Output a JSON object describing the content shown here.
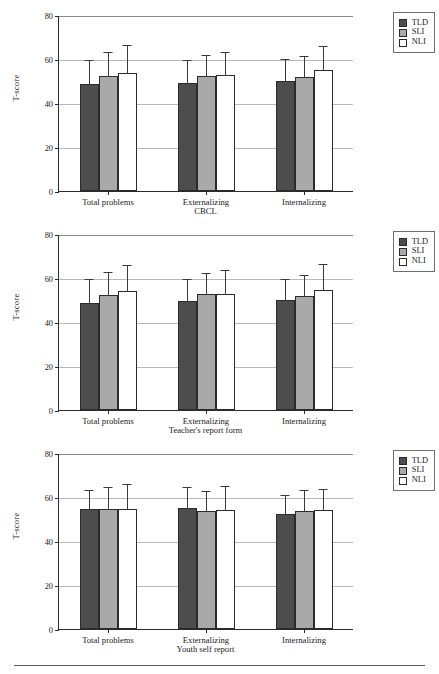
{
  "figure": {
    "bottom_rule": true,
    "colors": {
      "tld": "#4d4d4d",
      "sli": "#a9a9a9",
      "nli": "#ffffff",
      "axis": "#2b2b2b",
      "grid": "#b9b9b9"
    }
  },
  "legend": {
    "items": [
      {
        "label": "TLD",
        "key": "tld"
      },
      {
        "label": "SLI",
        "key": "sli"
      },
      {
        "label": "NLI",
        "key": "nli"
      }
    ]
  },
  "axes": {
    "ylabel": "T-score",
    "yticks": [
      "0",
      "20",
      "40",
      "60",
      "80"
    ],
    "categories": [
      "Total problems",
      "Externalizing",
      "Internalizing"
    ]
  },
  "panels": [
    {
      "xlabel": "CBCL"
    },
    {
      "xlabel": "Teacher's report form"
    },
    {
      "xlabel": "Youth self report"
    }
  ],
  "chart_data": [
    {
      "type": "bar",
      "title": "",
      "xlabel": "CBCL",
      "ylabel": "T-score",
      "ylim": [
        0,
        80
      ],
      "yticks": [
        0,
        20,
        40,
        60,
        80
      ],
      "grid": true,
      "legend_position": "top-right",
      "categories": [
        "Total problems",
        "Externalizing",
        "Internalizing"
      ],
      "series": [
        {
          "name": "TLD",
          "values": [
            48.5,
            49.3,
            49.8
          ],
          "errors": [
            11.3,
            10.6,
            10.5
          ]
        },
        {
          "name": "SLI",
          "values": [
            52.3,
            52.5,
            51.7
          ],
          "errors": [
            11.2,
            10.0,
            10.0
          ]
        },
        {
          "name": "NLI",
          "values": [
            53.8,
            52.6,
            54.8
          ],
          "errors": [
            13.2,
            11.2,
            11.6
          ]
        }
      ]
    },
    {
      "type": "bar",
      "title": "",
      "xlabel": "Teacher's report form",
      "ylabel": "T-score",
      "ylim": [
        0,
        80
      ],
      "yticks": [
        0,
        20,
        40,
        60,
        80
      ],
      "grid": true,
      "legend_position": "top-right",
      "categories": [
        "Total problems",
        "Externalizing",
        "Internalizing"
      ],
      "series": [
        {
          "name": "TLD",
          "values": [
            48.6,
            49.4,
            49.8
          ],
          "errors": [
            11.4,
            10.6,
            10.4
          ]
        },
        {
          "name": "SLI",
          "values": [
            52.4,
            52.6,
            51.7
          ],
          "errors": [
            10.8,
            10.1,
            10.1
          ]
        },
        {
          "name": "NLI",
          "values": [
            53.9,
            52.6,
            54.7
          ],
          "errors": [
            12.6,
            11.3,
            12.0
          ]
        }
      ]
    },
    {
      "type": "bar",
      "title": "",
      "xlabel": "Youth self report",
      "ylabel": "T-score",
      "ylim": [
        0,
        80
      ],
      "yticks": [
        0,
        20,
        40,
        60,
        80
      ],
      "grid": true,
      "legend_position": "top-right",
      "categories": [
        "Total problems",
        "Externalizing",
        "Internalizing"
      ],
      "series": [
        {
          "name": "TLD",
          "values": [
            54.5,
            54.9,
            52.2
          ],
          "errors": [
            9.3,
            10.3,
            9.3
          ]
        },
        {
          "name": "SLI",
          "values": [
            54.7,
            53.8,
            53.8
          ],
          "errors": [
            10.4,
            9.5,
            10.0
          ]
        },
        {
          "name": "NLI",
          "values": [
            54.5,
            54.0,
            53.9
          ],
          "errors": [
            12.0,
            11.6,
            10.3
          ]
        }
      ]
    }
  ]
}
